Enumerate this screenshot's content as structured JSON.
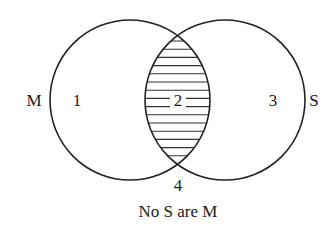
{
  "diagram": {
    "type": "venn",
    "caption": "No S are M",
    "sets": [
      {
        "name": "M",
        "label": "M",
        "cx": 130,
        "cy": 100,
        "r": 80
      },
      {
        "name": "S",
        "label": "S",
        "cx": 225,
        "cy": 100,
        "r": 80
      }
    ],
    "regions": [
      {
        "id": "1",
        "label": "1",
        "x": 77,
        "y": 106,
        "shaded": false
      },
      {
        "id": "2",
        "label": "2",
        "x": 178,
        "y": 106,
        "shaded": true
      },
      {
        "id": "3",
        "label": "3",
        "x": 273,
        "y": 106,
        "shaded": false
      },
      {
        "id": "4",
        "label": "4",
        "x": 178,
        "y": 191,
        "shaded": false
      }
    ],
    "shading": "horizontal-lines",
    "colors": {
      "stroke": "#222222",
      "background": "#ffffff"
    }
  }
}
